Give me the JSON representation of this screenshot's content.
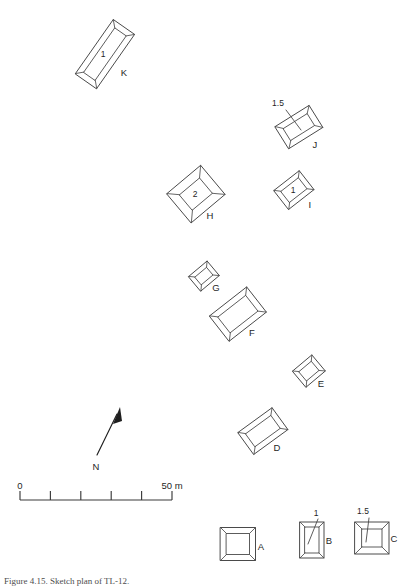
{
  "figure": {
    "caption": "Figure 4.15. Sketch plan of TL-12.",
    "background_color": "#ffffff",
    "line_color": "#4a4a4a",
    "text_color": "#1f1f1f"
  },
  "north_arrow": {
    "label": "N",
    "bearing_note": "arrow points up and to the right"
  },
  "scale_bar": {
    "start_label": "0",
    "end_label": "50 m",
    "divisions": 5,
    "segment_length_m": 10,
    "total_length_m": 50
  },
  "structures": [
    {
      "id": "K",
      "label": "K",
      "depth_label": "1",
      "depth_placement": "inside",
      "shape": "rectangle",
      "cx": 105,
      "cy": 54,
      "w": 66,
      "h": 26,
      "rot": -55,
      "inset": 6,
      "label_dx": 19,
      "label_dy": 22,
      "depth_dx": -2,
      "depth_dy": 3
    },
    {
      "id": "J",
      "label": "J",
      "depth_label": "1.5",
      "depth_placement": "callout",
      "shape": "rectangle",
      "cx": 299,
      "cy": 127,
      "w": 40,
      "h": 26,
      "rot": -32,
      "inset": 6,
      "label_dx": 16,
      "label_dy": 21,
      "callout_text_x": 278,
      "callout_text_y": 106,
      "callout_from_x": 286,
      "callout_from_y": 110,
      "callout_to_x": 301,
      "callout_to_y": 130
    },
    {
      "id": "H",
      "label": "H",
      "depth_label": "2",
      "depth_placement": "inside",
      "shape": "rectangle",
      "cx": 196,
      "cy": 194,
      "w": 44,
      "h": 38,
      "rot": -40,
      "inset": 9,
      "label_dx": 14,
      "label_dy": 25,
      "depth_dx": -1,
      "depth_dy": 3
    },
    {
      "id": "I",
      "label": "I",
      "depth_label": "1",
      "depth_placement": "inside",
      "shape": "rectangle",
      "cx": 294,
      "cy": 190,
      "w": 32,
      "h": 24,
      "rot": -38,
      "inset": 5,
      "label_dx": 16,
      "label_dy": 18,
      "depth_dx": -1,
      "depth_dy": 3
    },
    {
      "id": "G",
      "label": "G",
      "depth_label": "",
      "depth_placement": "none",
      "shape": "rectangle",
      "cx": 204,
      "cy": 276,
      "w": 24,
      "h": 19,
      "rot": -40,
      "inset": 4.5,
      "label_dx": 12,
      "label_dy": 15,
      "depth_dx": 0,
      "depth_dy": 0
    },
    {
      "id": "F",
      "label": "F",
      "depth_label": "",
      "depth_placement": "none",
      "shape": "rectangle",
      "cx": 238,
      "cy": 314,
      "w": 47,
      "h": 32,
      "rot": -38,
      "inset": 6,
      "label_dx": 14,
      "label_dy": 22,
      "depth_dx": 0,
      "depth_dy": 0
    },
    {
      "id": "E",
      "label": "E",
      "depth_label": "",
      "depth_placement": "none",
      "shape": "rectangle",
      "cx": 309,
      "cy": 371,
      "w": 25,
      "h": 21,
      "rot": -40,
      "inset": 4.5,
      "label_dx": 12,
      "label_dy": 16,
      "depth_dx": 0,
      "depth_dy": 0
    },
    {
      "id": "D",
      "label": "D",
      "depth_label": "",
      "depth_placement": "none",
      "shape": "rectangle",
      "cx": 263,
      "cy": 431,
      "w": 42,
      "h": 27,
      "rot": -36,
      "inset": 5.5,
      "label_dx": 14,
      "label_dy": 20,
      "depth_dx": 0,
      "depth_dy": 0
    },
    {
      "id": "A",
      "label": "A",
      "depth_label": "",
      "depth_placement": "none",
      "shape": "rectangle",
      "cx": 238,
      "cy": 544,
      "w": 35,
      "h": 33,
      "rot": 0,
      "inset": 6,
      "label_dx": 23,
      "label_dy": 6,
      "depth_dx": 0,
      "depth_dy": 0
    },
    {
      "id": "B",
      "label": "B",
      "depth_label": "1",
      "depth_placement": "callout",
      "shape": "rectangle",
      "cx": 312,
      "cy": 540,
      "w": 24,
      "h": 36,
      "rot": 0,
      "inset": 5,
      "label_dx": 17,
      "label_dy": 4,
      "callout_text_x": 316,
      "callout_text_y": 516,
      "callout_from_x": 318,
      "callout_from_y": 519,
      "callout_to_x": 308,
      "callout_to_y": 544
    },
    {
      "id": "C",
      "label": "C",
      "depth_label": "1.5",
      "depth_placement": "callout",
      "shape": "rectangle",
      "cx": 372,
      "cy": 538,
      "w": 34,
      "h": 32,
      "rot": 0,
      "inset": 7,
      "label_dx": 22,
      "label_dy": 4,
      "callout_text_x": 363,
      "callout_text_y": 514,
      "callout_from_x": 369,
      "callout_from_y": 518,
      "callout_to_x": 366,
      "callout_to_y": 542
    }
  ]
}
